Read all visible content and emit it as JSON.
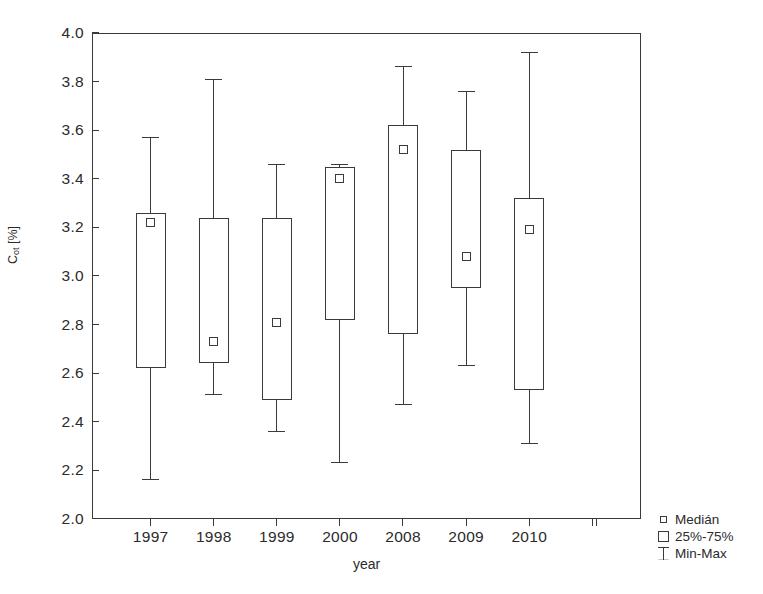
{
  "chart_data": {
    "type": "box",
    "title": "",
    "xlabel": "year",
    "ylabel": "Cot [%]",
    "ylabel_base": "C",
    "ylabel_sub": "ot",
    "ylabel_unit": " [%]",
    "categories": [
      "1997",
      "1998",
      "1999",
      "2000",
      "2008",
      "2009",
      "2010"
    ],
    "ylim": [
      2.0,
      4.0
    ],
    "yticks": [
      "4.0",
      "3.8",
      "3.6",
      "3.4",
      "3.2",
      "3.0",
      "2.8",
      "2.6",
      "2.4",
      "2.2",
      "2.0"
    ],
    "ytick_values": [
      4.0,
      3.8,
      3.6,
      3.4,
      3.2,
      3.0,
      2.8,
      2.6,
      2.4,
      2.2,
      2.0
    ],
    "grid": false,
    "legend_position": "bottom-right",
    "boxes": [
      {
        "category": "1997",
        "min": 2.16,
        "q1": 2.62,
        "median": 3.22,
        "q3": 3.26,
        "max": 3.57
      },
      {
        "category": "1998",
        "min": 2.51,
        "q1": 2.64,
        "median": 2.73,
        "q3": 3.24,
        "max": 3.81
      },
      {
        "category": "1999",
        "min": 2.36,
        "q1": 2.49,
        "median": 2.81,
        "q3": 3.24,
        "max": 3.46
      },
      {
        "category": "2000",
        "min": 2.23,
        "q1": 2.82,
        "median": 3.4,
        "q3": 3.45,
        "max": 3.46
      },
      {
        "category": "2008",
        "min": 2.47,
        "q1": 2.76,
        "median": 3.52,
        "q3": 3.62,
        "max": 3.86
      },
      {
        "category": "2009",
        "min": 2.63,
        "q1": 2.95,
        "median": 3.08,
        "q3": 3.52,
        "max": 3.76
      },
      {
        "category": "2010",
        "min": 2.31,
        "q1": 2.53,
        "median": 3.19,
        "q3": 3.32,
        "max": 3.92
      }
    ]
  },
  "legend": {
    "items": [
      {
        "symbol": "median-marker",
        "label": "Medián"
      },
      {
        "symbol": "box-marker",
        "label": "25%-75%"
      },
      {
        "symbol": "minmax-marker",
        "label": "Min-Max"
      }
    ]
  }
}
